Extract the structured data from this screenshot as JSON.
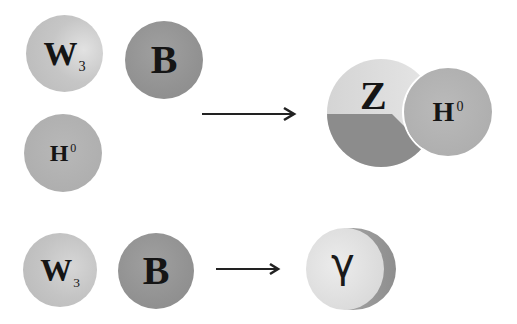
{
  "diagram": {
    "colors": {
      "background": "#ffffff",
      "w3_fill": "#c3c3c3",
      "w3_highlight": "#dcdcdc",
      "b_fill": "#959595",
      "h_fill": "#b2b2b2",
      "z_light": "#d9d9d9",
      "z_dark": "#8c8c8c",
      "photon_fill": "#e2e2e2",
      "photon_crescent": "#9a9a9a",
      "text": "#151515",
      "arrow": "#222222"
    },
    "top_row": {
      "inputs": [
        {
          "id": "w3",
          "symbol": "W",
          "subscript": "3",
          "superscript": ""
        },
        {
          "id": "b",
          "symbol": "B",
          "subscript": "",
          "superscript": ""
        },
        {
          "id": "h",
          "symbol": "H",
          "subscript": "",
          "superscript": "0"
        }
      ],
      "arrow": "right-arrow",
      "outputs": [
        {
          "id": "z",
          "symbol": "Z",
          "subscript": "",
          "superscript": ""
        },
        {
          "id": "h",
          "symbol": "H",
          "subscript": "",
          "superscript": "0"
        }
      ]
    },
    "bottom_row": {
      "inputs": [
        {
          "id": "w3",
          "symbol": "W",
          "subscript": "3",
          "superscript": ""
        },
        {
          "id": "b",
          "symbol": "B",
          "subscript": "",
          "superscript": ""
        }
      ],
      "arrow": "right-arrow",
      "outputs": [
        {
          "id": "photon",
          "symbol": "γ",
          "subscript": "",
          "superscript": ""
        }
      ]
    }
  }
}
